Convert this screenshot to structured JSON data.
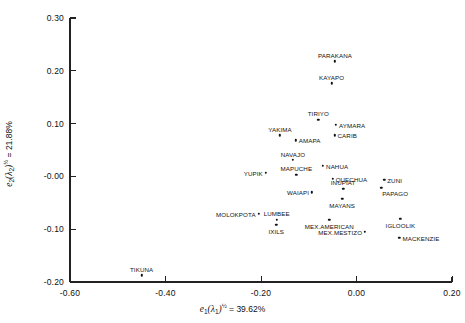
{
  "chart_data": {
    "type": "scatter",
    "title": "",
    "xlabel": "e1(λ1)½ = 39.62%",
    "ylabel": "e2(λ2)½ = 21.88%",
    "xlabel_parts": {
      "symbol": "e",
      "sub": "1",
      "paren": "(λ",
      "paren_sub": "1",
      "paren_close": ")",
      "exp": "½",
      "eq": " = 39.62%"
    },
    "ylabel_parts": {
      "symbol": "e",
      "sub": "2",
      "paren": "(λ",
      "paren_sub": "2",
      "paren_close": ")",
      "exp": "½",
      "eq": " = 21.88%"
    },
    "xlim": [
      -0.6,
      0.2
    ],
    "ylim": [
      -0.2,
      0.3
    ],
    "xticks": [
      "-0.60",
      "-0.40",
      "-0.20",
      "0.00",
      "0.20"
    ],
    "xtick_values": [
      -0.6,
      -0.4,
      -0.2,
      0.0,
      0.2
    ],
    "yticks": [
      "0.30",
      "0.20",
      "0.10",
      "-0.00",
      "-0.10",
      "-0.20"
    ],
    "ytick_values": [
      0.3,
      0.2,
      0.1,
      0.0,
      -0.1,
      -0.2
    ],
    "grid": false,
    "legend": "none",
    "spines": [
      "left",
      "bottom"
    ],
    "points": [
      {
        "label": "PARAKANA",
        "x": -0.045,
        "y": 0.218,
        "label_pos": "above"
      },
      {
        "label": "KAYAPO",
        "x": -0.052,
        "y": 0.176,
        "label_pos": "above"
      },
      {
        "label": "TIRIYO",
        "x": -0.08,
        "y": 0.107,
        "label_pos": "above"
      },
      {
        "label": "AYMARA",
        "x": -0.043,
        "y": 0.098,
        "label_pos": "right"
      },
      {
        "label": "YAKIMA",
        "x": -0.16,
        "y": 0.078,
        "label_pos": "above"
      },
      {
        "label": "CARIB",
        "x": -0.046,
        "y": 0.078,
        "label_pos": "right"
      },
      {
        "label": "AMAPA",
        "x": -0.127,
        "y": 0.068,
        "label_pos": "right"
      },
      {
        "label": "NAVAJO",
        "x": -0.133,
        "y": 0.031,
        "label_pos": "above"
      },
      {
        "label": "NAHUA",
        "x": -0.07,
        "y": 0.02,
        "label_pos": "right"
      },
      {
        "label": "YUPIK",
        "x": -0.19,
        "y": 0.007,
        "label_pos": "left-mark"
      },
      {
        "label": "MAPUCHE",
        "x": -0.126,
        "y": 0.003,
        "label_pos": "above"
      },
      {
        "label": "QUECHUA",
        "x": -0.05,
        "y": -0.004,
        "label_pos": "right"
      },
      {
        "label": "ZUNI",
        "x": 0.058,
        "y": -0.006,
        "label_pos": "right"
      },
      {
        "label": "INUPIAT",
        "x": -0.028,
        "y": -0.023,
        "label_pos": "above"
      },
      {
        "label": "PAPAGO",
        "x": 0.052,
        "y": -0.022,
        "label_pos": "right-low"
      },
      {
        "label": "WAIAPI",
        "x": -0.093,
        "y": -0.03,
        "label_pos": "left-mark"
      },
      {
        "label": "MAYANS",
        "x": -0.03,
        "y": -0.042,
        "label_pos": "below"
      },
      {
        "label": "MOLOKPOTA",
        "x": -0.205,
        "y": -0.071,
        "label_pos": "left-mark"
      },
      {
        "label": "LUMBEE",
        "x": -0.167,
        "y": -0.082,
        "label_pos": "above"
      },
      {
        "label": "IGLOOLIK",
        "x": 0.092,
        "y": -0.08,
        "label_pos": "below"
      },
      {
        "label": "IXILS",
        "x": -0.168,
        "y": -0.092,
        "label_pos": "below"
      },
      {
        "label": "MEX.AMERICAN",
        "x": -0.057,
        "y": -0.082,
        "label_pos": "below"
      },
      {
        "label": "MEX.MESTIZO",
        "x": 0.018,
        "y": -0.105,
        "label_pos": "left-mark"
      },
      {
        "label": "MACKENZIE",
        "x": 0.09,
        "y": -0.116,
        "label_pos": "right"
      },
      {
        "label": "TIKUNA",
        "x": -0.45,
        "y": -0.187,
        "label_pos": "above"
      }
    ]
  }
}
